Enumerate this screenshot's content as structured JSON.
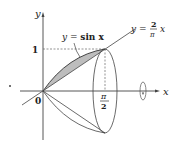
{
  "figure": {
    "axes": {
      "x_label": "x",
      "y_label": "y",
      "origin_label": "0",
      "y_tick_label": "1",
      "x_tick_numerator": "π",
      "x_tick_denominator": "2"
    },
    "curves": [
      {
        "name": "sine",
        "label_lhs": "y = ",
        "label_rhs": "sin x",
        "equation": "y = sin x"
      },
      {
        "name": "line",
        "label_lhs": "y = ",
        "frac_num": "2",
        "frac_den": "π",
        "var": "x",
        "equation": "y = (2/π) x"
      }
    ],
    "shaded_region": "region between y = sin x and y = (2/π)x for 0 ≤ x ≤ π/2",
    "solid": "solid of revolution about the x-axis",
    "colors": {
      "stroke": "#333333",
      "shade": "#bdbdbd",
      "dashed": "#666666"
    }
  }
}
